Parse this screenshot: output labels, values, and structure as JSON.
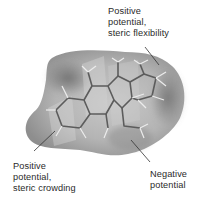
{
  "figure": {
    "colors": {
      "background": "#ffffff",
      "surface_light": "#c4c4c4",
      "surface_mid": "#a8a8a8",
      "surface_dark": "#7a7a7a",
      "bonds": "#5a5a5a",
      "hydrogens": "#e8e8e8",
      "text": "#2a2a2a"
    },
    "labels": {
      "top_right": {
        "line1": "Positive",
        "line2": "potential,",
        "line3": "steric flexibility"
      },
      "bottom_left": {
        "line1": "Positive",
        "line2": "potential,",
        "line3": "steric crowding"
      },
      "bottom_right": {
        "line1": "Negative",
        "line2": "potential"
      }
    }
  }
}
